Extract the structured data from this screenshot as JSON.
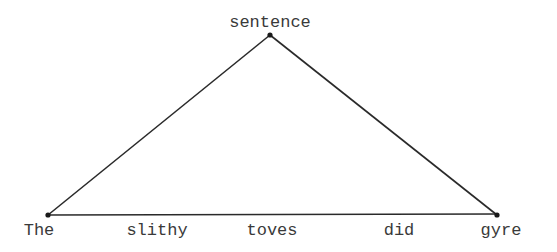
{
  "diagram": {
    "type": "parse-tree-triangle",
    "root": {
      "label": "sentence",
      "x": 270,
      "y": 35
    },
    "leaves": [
      {
        "label": "The",
        "x": 38
      },
      {
        "label": "slithy",
        "x": 155
      },
      {
        "label": "toves",
        "x": 270
      },
      {
        "label": "did",
        "x": 382
      },
      {
        "label": "gyre",
        "x": 497
      }
    ],
    "base": {
      "left_x": 48,
      "right_x": 497,
      "y": 215
    },
    "line_color": "#2a2a2a",
    "text_color": "#3a3a3a"
  }
}
